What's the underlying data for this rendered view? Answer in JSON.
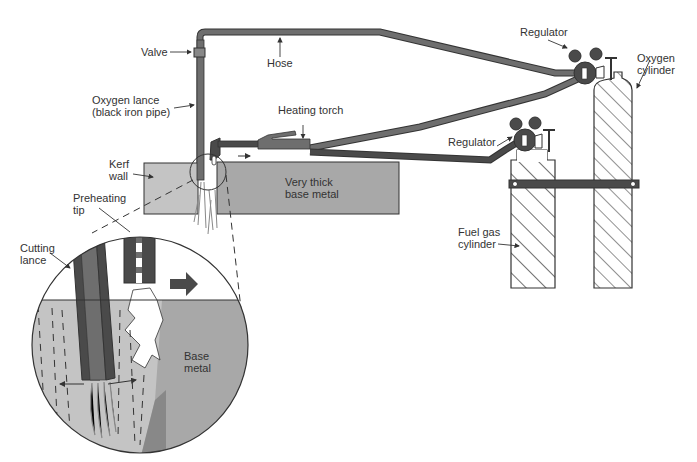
{
  "labels": {
    "valve": "Valve",
    "hose": "Hose",
    "oxygen_lance_1": "Oxygen lance",
    "oxygen_lance_2": "(black iron pipe)",
    "heating_torch": "Heating torch",
    "kerf_1": "Kerf",
    "kerf_2": "wall",
    "very_thick_1": "Very thick",
    "very_thick_2": "base metal",
    "preheating_1": "Preheating",
    "preheating_2": "tip",
    "cutting_lance_1": "Cutting",
    "cutting_lance_2": "lance",
    "base_metal_1": "Base",
    "base_metal_2": "metal",
    "regulator_top": "Regulator",
    "regulator_mid": "Regulator",
    "oxygen_cyl_1": "Oxygen",
    "oxygen_cyl_2": "cylinder",
    "fuel_gas_1": "Fuel gas",
    "fuel_gas_2": "cylinder"
  },
  "colors": {
    "dark": "#4a4a4a",
    "hose": "#6e6e6e",
    "metal": "#a8a8a8",
    "metal_light": "#c4c4c4",
    "outline": "#333333"
  }
}
